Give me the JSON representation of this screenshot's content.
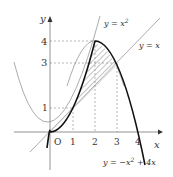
{
  "diagram": {
    "axes": {
      "x_label": "x",
      "y_label": "y",
      "origin_label": "O"
    },
    "x_ticks": [
      "1",
      "2",
      "3",
      "4"
    ],
    "y_ticks": [
      "1",
      "3",
      "4"
    ],
    "curves": [
      {
        "label": "y = x²",
        "lab_a": "y = x",
        "lab_sup": "2"
      },
      {
        "label": "y = x",
        "lab": "y = x"
      },
      {
        "label": "y = −x² + 4x",
        "lab_a": "y = −x",
        "lab_sup": "2",
        "lab_b": " + 4x"
      }
    ],
    "shaded_region": "between y=x² (0≤x≤2), y=−x²+4x, and y=x"
  }
}
